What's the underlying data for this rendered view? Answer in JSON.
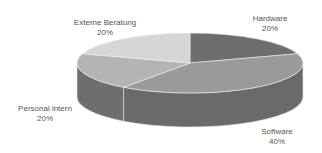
{
  "chart_data": {
    "type": "pie",
    "style": "3d",
    "title": "",
    "legend": "none",
    "categories": [
      "Hardware",
      "Software",
      "Personal intern",
      "Externe Beratung"
    ],
    "values": [
      20,
      40,
      20,
      20
    ],
    "unit": "%",
    "labels": [
      {
        "name": "Hardware",
        "value": "20%"
      },
      {
        "name": "Software",
        "value": "40%"
      },
      {
        "name": "Personal intern",
        "value": "20%"
      },
      {
        "name": "Externe Beratung",
        "value": "20%"
      }
    ],
    "colors": {
      "Hardware": "#6e6e6e",
      "Software": "#9a9a9a",
      "Personal intern": "#b4b4b4",
      "Externe Beratung": "#d6d6d6"
    },
    "side_colors": {
      "Hardware": "#5a5a5a",
      "Software": "#6a6a6a",
      "Personal intern": "#6e6e6e",
      "Externe Beratung": "#8a8a8a"
    }
  }
}
